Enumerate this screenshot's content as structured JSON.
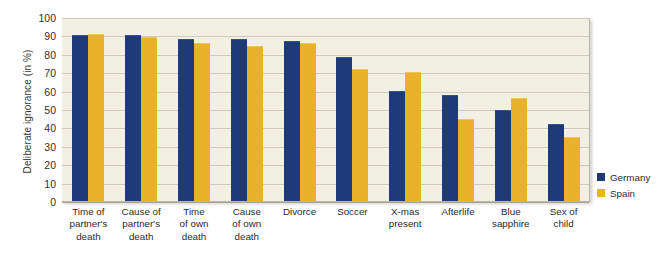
{
  "chart_data": {
    "type": "bar",
    "title": "",
    "xlabel": "",
    "ylabel": "Deliberate ignorance (in %)",
    "ylim": [
      0,
      100
    ],
    "yticks": [
      100,
      90,
      80,
      70,
      60,
      50,
      40,
      30,
      20,
      10,
      0
    ],
    "grid": true,
    "legend_position": "right",
    "categories": [
      "Time of partner's death",
      "Cause of partner's death",
      "Time of own death",
      "Cause of own death",
      "Divorce",
      "Soccer",
      "X-mas present",
      "Afterlife",
      "Blue sapphire",
      "Sex of child"
    ],
    "category_lines": [
      [
        "Time of",
        "partner's",
        "death"
      ],
      [
        "Cause of",
        "partner's",
        "death"
      ],
      [
        "Time",
        "of own",
        "death"
      ],
      [
        "Cause",
        "of own",
        "death"
      ],
      [
        "Divorce"
      ],
      [
        "Soccer"
      ],
      [
        "X-mas",
        "present"
      ],
      [
        "Afterlife"
      ],
      [
        "Blue",
        "sapphire"
      ],
      [
        "Sex of",
        "child"
      ]
    ],
    "series": [
      {
        "name": "Germany",
        "color": "#1e3a78",
        "values": [
          90,
          90,
          88,
          88,
          87,
          78,
          60,
          57.5,
          49.5,
          42
        ]
      },
      {
        "name": "Spain",
        "color": "#eab22a",
        "values": [
          90.5,
          89,
          86,
          84,
          86,
          71.5,
          70,
          44.5,
          56,
          35
        ]
      }
    ]
  },
  "legend": {
    "items": [
      {
        "label": "Germany",
        "color": "#1e3a78"
      },
      {
        "label": "Spain",
        "color": "#eab22a"
      }
    ]
  },
  "colors": {
    "germany": "#1e3a78",
    "spain": "#eab22a",
    "plot_background": "#f2efe3",
    "gridline": "#cfcbbc",
    "page_background": "#ffffff",
    "text": "#2b2b2b"
  }
}
